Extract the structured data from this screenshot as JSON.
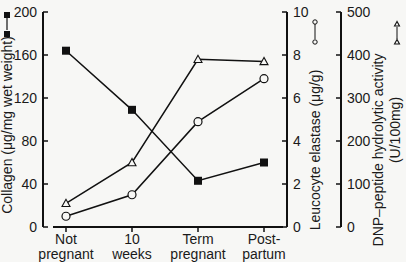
{
  "chart_data": {
    "type": "line",
    "title": "",
    "categories": [
      "Not pregnant",
      "10 weeks",
      "Term pregnant",
      "Post-partum"
    ],
    "category_lines": [
      [
        "Not",
        "pregnant"
      ],
      [
        "10",
        "weeks"
      ],
      [
        "Term",
        "pregnant"
      ],
      [
        "Post-",
        "partum"
      ]
    ],
    "axes": [
      {
        "id": "left",
        "label": "Collagen (μg/mg wet weight)",
        "ylim": [
          0,
          200
        ],
        "ticks": [
          0,
          40,
          80,
          120,
          160,
          200
        ],
        "legend_marker": "filled-square"
      },
      {
        "id": "middle",
        "label": "Leucocyte elastase  (μg/g)",
        "ylim": [
          0,
          10
        ],
        "ticks": [
          0,
          2,
          4,
          6,
          8,
          10
        ],
        "legend_marker": "open-circle"
      },
      {
        "id": "right",
        "label": "DNP–peptide hydrolytic activity",
        "label2": "(U/100mg)",
        "ylim": [
          0,
          500
        ],
        "ticks": [
          0,
          100,
          200,
          300,
          400,
          500
        ],
        "legend_marker": "open-triangle"
      }
    ],
    "series": [
      {
        "name": "Collagen",
        "axis": "left",
        "marker": "filled-square",
        "values": [
          164,
          109,
          43,
          60
        ]
      },
      {
        "name": "Leucocyte elastase",
        "axis": "middle",
        "marker": "open-circle",
        "values": [
          0.5,
          1.5,
          4.9,
          6.9
        ]
      },
      {
        "name": "DNP-peptide hydrolytic activity",
        "axis": "right",
        "marker": "open-triangle",
        "values": [
          55,
          150,
          390,
          385
        ]
      }
    ],
    "grid": false,
    "legend_position": "inline-with-axis-labels"
  }
}
